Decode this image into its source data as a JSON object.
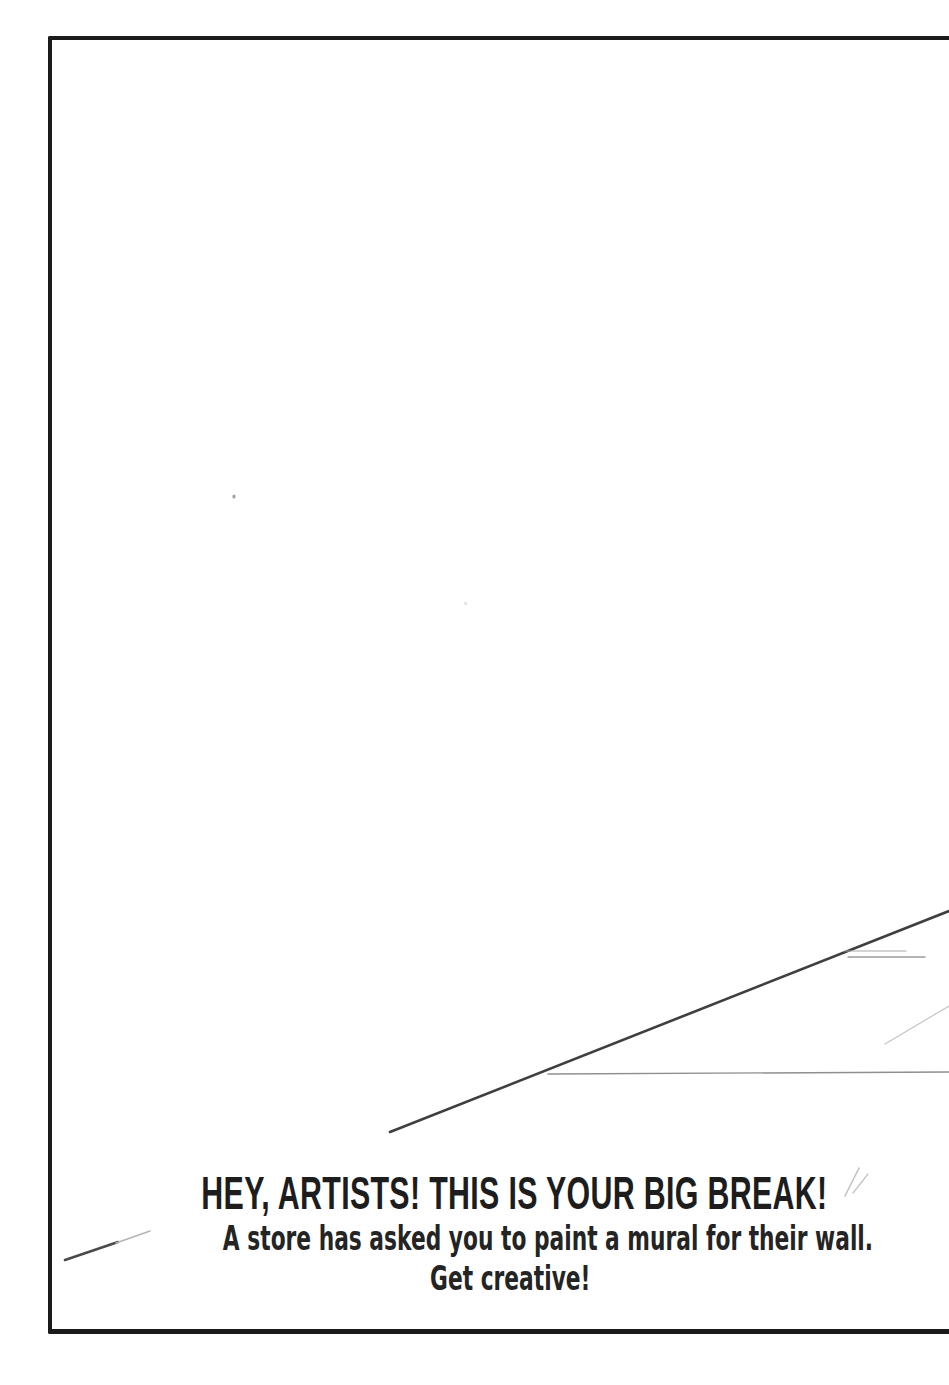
{
  "page": {
    "headline": "HEY, ARTISTS! THIS IS YOUR BIG BREAK!",
    "subline1": "A store has asked you to paint a mural for their wall.",
    "subline2": "Get creative!"
  },
  "colors": {
    "paper": "#ffffff",
    "frame_ink": "#1b1b1b",
    "text_ink": "#1e1e1e",
    "pencil_dark": "#3f3f3f",
    "pencil_light": "#c4c4c4"
  },
  "sketch": {
    "strokes": [
      {
        "name": "perspective-diagonal-stroke",
        "x1": 390,
        "y1": 1132,
        "x2": 949,
        "y2": 911,
        "color": "#3f3f3f",
        "width": 2.6,
        "opacity": 1
      },
      {
        "name": "horizontal-guide-stroke",
        "x1": 548,
        "y1": 1074,
        "x2": 949,
        "y2": 1072,
        "color": "#8f8f8f",
        "width": 1.4,
        "opacity": 1
      },
      {
        "name": "short-dash-stroke-upper",
        "x1": 845,
        "y1": 951,
        "x2": 906,
        "y2": 951,
        "color": "#a8a8a8",
        "width": 1.2,
        "opacity": 1
      },
      {
        "name": "short-dash-stroke-lower",
        "x1": 848,
        "y1": 957,
        "x2": 925,
        "y2": 957,
        "color": "#9b9b9b",
        "width": 1.3,
        "opacity": 1
      },
      {
        "name": "faint-diagonal-stroke",
        "x1": 885,
        "y1": 1044,
        "x2": 949,
        "y2": 1006,
        "color": "#c4c4c4",
        "width": 1.2,
        "opacity": 1
      },
      {
        "name": "corner-pencil-stroke-dark",
        "x1": 65,
        "y1": 1260,
        "x2": 118,
        "y2": 1242,
        "color": "#4a4a4a",
        "width": 2.6,
        "opacity": 1
      },
      {
        "name": "corner-pencil-stroke-tip",
        "x1": 116,
        "y1": 1243,
        "x2": 150,
        "y2": 1231,
        "color": "#b5b5b5",
        "width": 1.6,
        "opacity": 1
      },
      {
        "name": "headline-slash-mark-1",
        "x1": 845,
        "y1": 1196,
        "x2": 859,
        "y2": 1168,
        "color": "#c2c2c2",
        "width": 1.6,
        "opacity": 1
      },
      {
        "name": "headline-slash-mark-2",
        "x1": 853,
        "y1": 1193,
        "x2": 868,
        "y2": 1174,
        "color": "#c8c8c8",
        "width": 1.4,
        "opacity": 1
      },
      {
        "name": "paper-speck",
        "x1": 234,
        "y1": 496,
        "x2": 234,
        "y2": 497,
        "color": "#8a8a8a",
        "width": 3,
        "opacity": 0.8
      },
      {
        "name": "paper-speck-faint",
        "x1": 465,
        "y1": 603,
        "x2": 466,
        "y2": 604,
        "color": "#d8d8d8",
        "width": 2.5,
        "opacity": 0.7
      }
    ]
  }
}
